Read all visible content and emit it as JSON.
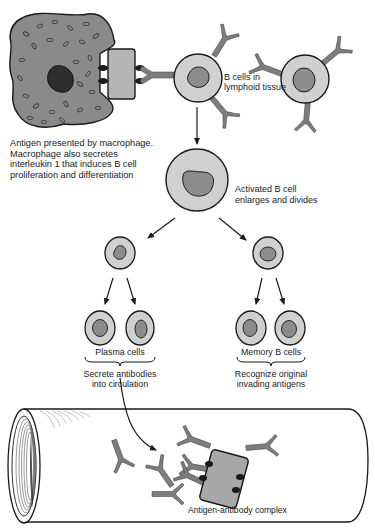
{
  "diagram": {
    "colors": {
      "macrophage_fill": "#8a8a8a",
      "macrophage_nucleus": "#2e2e2e",
      "cell_cytoplasm": "#d0d0d0",
      "cell_nucleus": "#8c8c8c",
      "antigen_fill": "#b5b5b5",
      "antibody_fill": "#7d7d7d",
      "outline": "#1a1a1a"
    },
    "labels": {
      "b_cells_lymphoid": "B cells in\nlymphoid tissue",
      "macrophage_caption": "Antigen presented by macrophage.\nMacrophage also secretes\ninterleukin 1 that induces B cell\nproliferation and differentiation",
      "activated_b_cell": "Activated B cell\nenlarges and divides",
      "plasma_cells": "Plasma cells",
      "plasma_function": "Secrete antibodies\ninto circulation",
      "memory_b_cells": "Memory B cells",
      "memory_function": "Recognize original\ninvading antigens",
      "antigen_antibody_complex": "Antigen-antibody complex"
    },
    "nodes": [
      {
        "id": "macrophage",
        "type": "macrophage-with-antigen"
      },
      {
        "id": "b-cell-1",
        "type": "b-cell-receptor-bound"
      },
      {
        "id": "b-cell-2",
        "type": "b-cell"
      },
      {
        "id": "activated-b-cell",
        "type": "activated-b-cell"
      },
      {
        "id": "plasma-precursor",
        "type": "small-cell"
      },
      {
        "id": "memory-precursor",
        "type": "small-cell"
      },
      {
        "id": "plasma-cell-1",
        "type": "plasma-cell"
      },
      {
        "id": "plasma-cell-2",
        "type": "plasma-cell"
      },
      {
        "id": "memory-cell-1",
        "type": "memory-cell"
      },
      {
        "id": "memory-cell-2",
        "type": "memory-cell"
      },
      {
        "id": "blood-vessel",
        "type": "vessel"
      },
      {
        "id": "antigen-antibody-complex",
        "type": "complex"
      }
    ],
    "edges": [
      {
        "from": "b-cell-1",
        "to": "activated-b-cell"
      },
      {
        "from": "activated-b-cell",
        "to": "plasma-precursor"
      },
      {
        "from": "activated-b-cell",
        "to": "memory-precursor"
      },
      {
        "from": "plasma-precursor",
        "to": "plasma-cell-1"
      },
      {
        "from": "plasma-precursor",
        "to": "plasma-cell-2"
      },
      {
        "from": "memory-precursor",
        "to": "memory-cell-1"
      },
      {
        "from": "memory-precursor",
        "to": "memory-cell-2"
      },
      {
        "from": "plasma-cells",
        "to": "blood-vessel"
      }
    ]
  }
}
